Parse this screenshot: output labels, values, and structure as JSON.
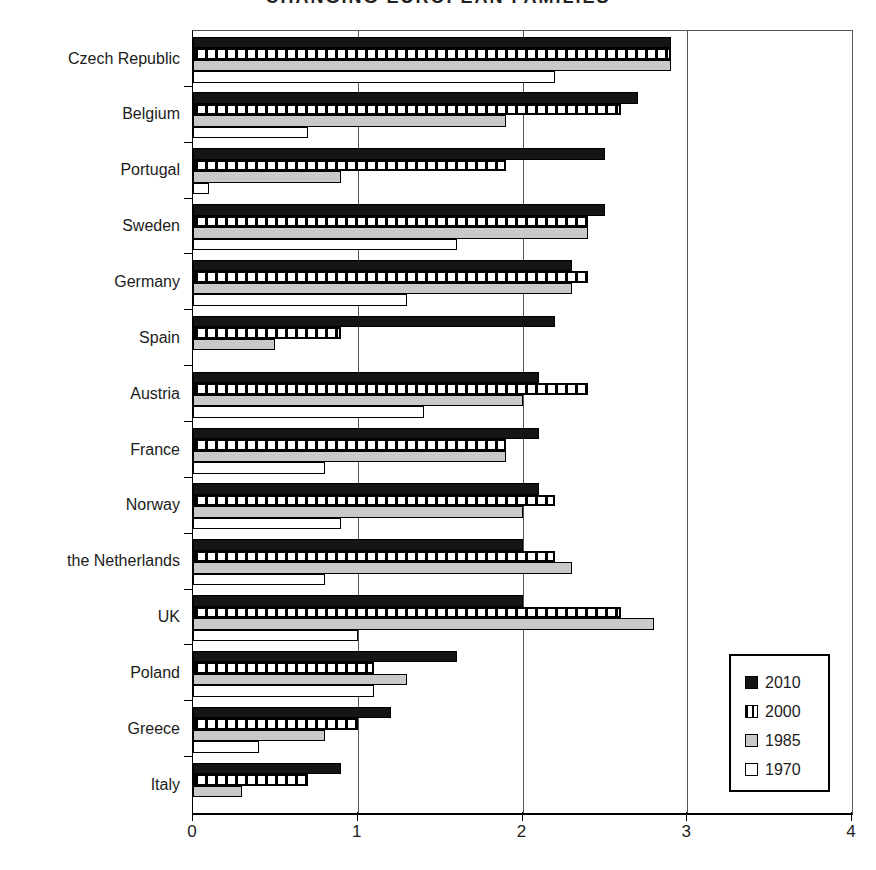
{
  "chart_data": {
    "type": "bar",
    "orientation": "horizontal",
    "title": "CHANGING EUROPEAN FAMILIES",
    "title_note": "title is partially cut off at the top edge of the image",
    "categories": [
      "Czech Republic",
      "Belgium",
      "Portugal",
      "Sweden",
      "Germany",
      "Spain",
      "Austria",
      "France",
      "Norway",
      "the Netherlands",
      "UK",
      "Poland",
      "Greece",
      "Italy"
    ],
    "series": [
      {
        "name": "2010",
        "style": "solid-black",
        "color": "#151515",
        "values": [
          2.9,
          2.7,
          2.5,
          2.5,
          2.3,
          2.2,
          2.1,
          2.1,
          2.1,
          2.0,
          2.0,
          1.6,
          1.2,
          0.9
        ]
      },
      {
        "name": "2000",
        "style": "vertical-stripes",
        "color": "#000000",
        "values": [
          2.9,
          2.6,
          1.9,
          2.4,
          2.4,
          0.9,
          2.4,
          1.9,
          2.2,
          2.2,
          2.6,
          1.1,
          1.0,
          0.7
        ]
      },
      {
        "name": "1985",
        "style": "solid-gray",
        "color": "#c9c9c9",
        "values": [
          2.9,
          1.9,
          0.9,
          2.4,
          2.3,
          0.5,
          2.0,
          1.9,
          2.0,
          2.3,
          2.8,
          1.3,
          0.8,
          0.3
        ]
      },
      {
        "name": "1970",
        "style": "solid-white",
        "color": "#ffffff",
        "values": [
          2.2,
          0.7,
          0.1,
          1.6,
          1.3,
          0,
          1.4,
          0.8,
          0.9,
          0.8,
          1.0,
          1.1,
          0.4,
          0
        ]
      }
    ],
    "xlabel": "",
    "ylabel": "",
    "xlim": [
      0,
      4
    ],
    "x_ticks": [
      "0",
      "1",
      "2",
      "3",
      "4"
    ],
    "gridlines_at": [
      1,
      2,
      3
    ],
    "grid": "vertical gridlines at 1, 2 and 3; plot box framed",
    "legend_position": "lower right, inside plot",
    "legend": [
      "2010",
      "2000",
      "1985",
      "1970"
    ]
  }
}
